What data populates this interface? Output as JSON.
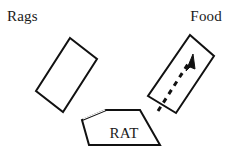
{
  "diagram": {
    "type": "y-maze-choice-diagram",
    "background_color": "#ffffff",
    "stroke_color": "#111111",
    "text_color": "#1a1a1a",
    "labels": {
      "left_arm": "Rags",
      "right_arm": "Food",
      "center_chamber": "RAT"
    },
    "shapes": {
      "left_arm": {
        "name": "rags-arm",
        "description": "rotated rectangle arm pointing up-left",
        "points": "70,38 97,59 63,112 36,91"
      },
      "right_arm": {
        "name": "food-arm",
        "description": "rotated rectangle arm pointing up-right",
        "points": "190,35 214,56 176,113 148,96"
      },
      "center_chamber": {
        "name": "rat-chamber",
        "description": "pentagon chamber at bottom center",
        "points": "106,110 140,110 160,145 89,145 82,120"
      }
    },
    "arrow": {
      "name": "path-arrow",
      "style": "dashed",
      "direction": "up-right",
      "dash_pattern": "5,5",
      "stroke_width": 3,
      "from": [
        158,
        111
      ],
      "to": [
        193,
        57
      ]
    }
  }
}
